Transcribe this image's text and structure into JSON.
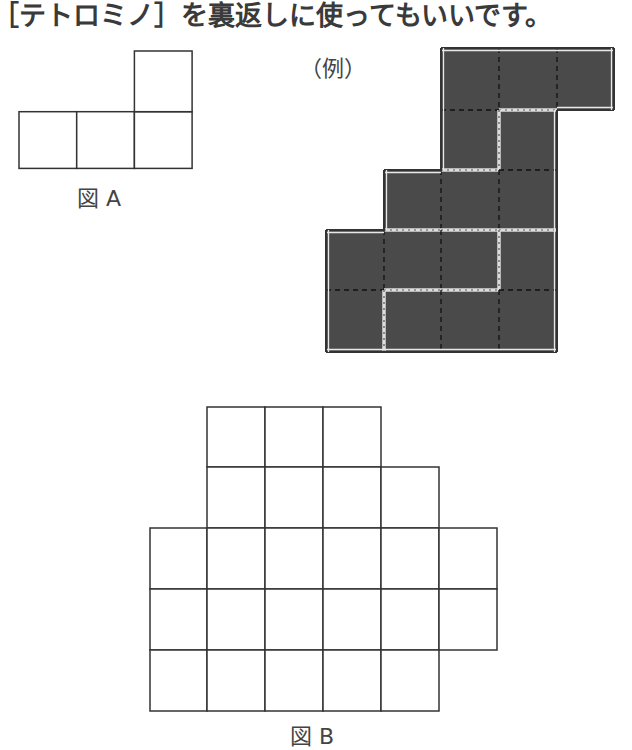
{
  "instruction": "［テトロミノ］を裏返しに使ってもいいです。",
  "figure_a": {
    "label": "図 A",
    "cells": [
      [
        0,
        1
      ],
      [
        1,
        1
      ],
      [
        2,
        1
      ],
      [
        2,
        0
      ]
    ]
  },
  "example": {
    "label": "（例）",
    "fill_color": "#4a4a4a",
    "cells": [
      [
        2,
        0
      ],
      [
        3,
        0
      ],
      [
        4,
        0
      ],
      [
        2,
        1
      ],
      [
        3,
        1
      ],
      [
        1,
        2
      ],
      [
        2,
        2
      ],
      [
        3,
        2
      ],
      [
        0,
        3
      ],
      [
        1,
        3
      ],
      [
        2,
        3
      ],
      [
        3,
        3
      ],
      [
        0,
        4
      ],
      [
        1,
        4
      ],
      [
        2,
        4
      ],
      [
        3,
        4
      ]
    ],
    "pieces": [
      [
        [
          2,
          0
        ],
        [
          3,
          0
        ],
        [
          4,
          0
        ],
        [
          2,
          1
        ]
      ],
      [
        [
          3,
          1
        ],
        [
          1,
          2
        ],
        [
          2,
          2
        ],
        [
          3,
          2
        ]
      ],
      [
        [
          0,
          3
        ],
        [
          1,
          3
        ],
        [
          2,
          3
        ],
        [
          0,
          4
        ]
      ],
      [
        [
          3,
          3
        ],
        [
          1,
          4
        ],
        [
          2,
          4
        ],
        [
          3,
          4
        ]
      ]
    ]
  },
  "figure_b": {
    "label": "図 B",
    "rows": [
      {
        "row": 0,
        "cols": [
          1,
          2,
          3
        ]
      },
      {
        "row": 1,
        "cols": [
          1,
          2,
          3,
          4
        ]
      },
      {
        "row": 2,
        "cols": [
          0,
          1,
          2,
          3,
          4,
          5
        ]
      },
      {
        "row": 3,
        "cols": [
          0,
          1,
          2,
          3,
          4,
          5
        ]
      },
      {
        "row": 4,
        "cols": [
          0,
          1,
          2,
          3,
          4
        ]
      }
    ]
  }
}
